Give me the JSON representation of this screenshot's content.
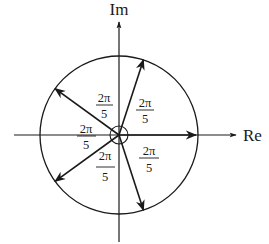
{
  "diagram": {
    "axes": {
      "horizontal_label": "Re",
      "vertical_label": "Im"
    },
    "center": [
      119,
      135
    ],
    "radius": 79,
    "vectors": [
      {
        "name": "root-0",
        "angle_deg": 0
      },
      {
        "name": "root-1",
        "angle_deg": 72
      },
      {
        "name": "root-2",
        "angle_deg": 144
      },
      {
        "name": "root-3",
        "angle_deg": 216
      },
      {
        "name": "root-4",
        "angle_deg": 288
      }
    ],
    "angle_labels": [
      {
        "numerator": "2π",
        "denominator": "5",
        "position": "upper-left-of-axis"
      },
      {
        "numerator": "2π",
        "denominator": "5",
        "position": "upper-right"
      },
      {
        "numerator": "2π",
        "denominator": "5",
        "position": "left"
      },
      {
        "numerator": "2π",
        "denominator": "5",
        "position": "lower-left"
      },
      {
        "numerator": "2π",
        "denominator": "5",
        "position": "lower-right"
      }
    ],
    "colors": {
      "stroke": "#1a1a1a",
      "background": "#ffffff"
    }
  }
}
